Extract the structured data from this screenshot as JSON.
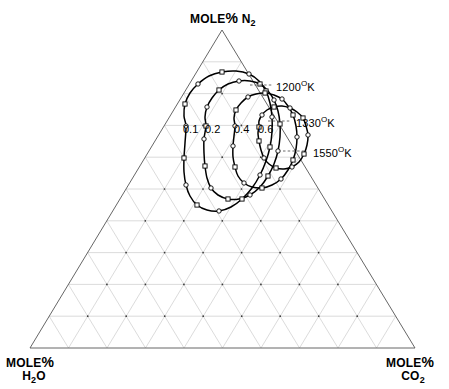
{
  "figure": {
    "kind": "ternary-phase-diagram",
    "background": "#ffffff",
    "ink": "#000000",
    "grid_color": "#b9b9b9",
    "axis_color": "#4a4a4a"
  },
  "axes": {
    "top": {
      "name": "mole-percent-n2",
      "line1": "MOLE",
      "percent": "%",
      "species": "N",
      "subscript": "2"
    },
    "bottom_left": {
      "name": "mole-percent-h2o",
      "line1": "MOLE",
      "percent": "%",
      "species": "H",
      "subscript": "2",
      "species_tail": "O"
    },
    "bottom_right": {
      "name": "mole-percent-co2",
      "line1": "MOLE",
      "percent": "%",
      "species": "CO",
      "subscript": "2"
    }
  },
  "temperature_labels": [
    {
      "value": "1200",
      "degree": "O",
      "unit": "K",
      "text": "1200OK"
    },
    {
      "value": "1330",
      "degree": "O",
      "unit": "K",
      "text": "1330OK"
    },
    {
      "value": "1550",
      "degree": "O",
      "unit": "K",
      "text": "1550OK"
    }
  ],
  "contour_value_labels": [
    "0.1",
    "0.2",
    "0.4",
    "0.6"
  ],
  "chart_data": {
    "type": "line",
    "title": "",
    "subtitle": "",
    "plot_kind": "ternary contour map",
    "xlabel": "",
    "ylabel": "",
    "grid": true,
    "legend_position": "none",
    "ternary": {
      "corners": {
        "top": "MOLE % N2",
        "bottom_left": "MOLE % H2O",
        "bottom_right": "MOLE % CO2"
      },
      "grid_divisions": 10,
      "apex_px": [
        222,
        30
      ],
      "left_px": [
        30,
        348
      ],
      "right_px": [
        415,
        348
      ]
    },
    "annotations": [
      {
        "label": "1200OK",
        "leader": true,
        "anchor_px": [
          272,
          85
        ],
        "text_px": [
          276,
          85
        ]
      },
      {
        "label": "1330OK",
        "leader": true,
        "anchor_px": [
          290,
          121
        ],
        "text_px": [
          296,
          121
        ]
      },
      {
        "label": "1550OK",
        "leader": true,
        "anchor_px": [
          305,
          151
        ],
        "text_px": [
          313,
          151
        ]
      }
    ],
    "contour_labels": [
      {
        "value": "0.1",
        "px": [
          188,
          131
        ]
      },
      {
        "value": "0.2",
        "px": [
          210,
          131
        ]
      },
      {
        "value": "0.4",
        "px": [
          239,
          131
        ]
      },
      {
        "value": "0.6",
        "px": [
          263,
          131
        ]
      }
    ],
    "series": [
      {
        "name": "0.1",
        "closed": true,
        "points_px": [
          [
            186,
            126
          ],
          [
            184,
            116
          ],
          [
            185,
            104
          ],
          [
            190,
            93
          ],
          [
            198,
            84
          ],
          [
            209,
            76
          ],
          [
            222,
            72
          ],
          [
            236,
            71
          ],
          [
            249,
            74
          ],
          [
            259,
            81
          ],
          [
            266,
            91
          ],
          [
            270,
            103
          ],
          [
            272,
            117
          ],
          [
            272,
            132
          ],
          [
            270,
            147
          ],
          [
            266,
            161
          ],
          [
            260,
            175
          ],
          [
            252,
            188
          ],
          [
            242,
            199
          ],
          [
            231,
            207
          ],
          [
            219,
            211
          ],
          [
            207,
            210
          ],
          [
            197,
            205
          ],
          [
            190,
            196
          ],
          [
            186,
            185
          ],
          [
            184,
            172
          ],
          [
            184,
            158
          ],
          [
            185,
            143
          ]
        ]
      },
      {
        "name": "0.2",
        "closed": true,
        "points_px": [
          [
            206,
            126
          ],
          [
            205,
            117
          ],
          [
            207,
            107
          ],
          [
            212,
            98
          ],
          [
            219,
            90
          ],
          [
            228,
            84
          ],
          [
            239,
            81
          ],
          [
            250,
            81
          ],
          [
            260,
            84
          ],
          [
            268,
            91
          ],
          [
            274,
            100
          ],
          [
            278,
            111
          ],
          [
            280,
            124
          ],
          [
            280,
            137
          ],
          [
            278,
            151
          ],
          [
            274,
            164
          ],
          [
            268,
            176
          ],
          [
            260,
            187
          ],
          [
            250,
            195
          ],
          [
            239,
            199
          ],
          [
            228,
            199
          ],
          [
            218,
            195
          ],
          [
            211,
            188
          ],
          [
            207,
            178
          ],
          [
            205,
            166
          ],
          [
            204,
            153
          ],
          [
            204,
            139
          ]
        ]
      },
      {
        "name": "0.4",
        "closed": true,
        "points_px": [
          [
            235,
            126
          ],
          [
            234,
            118
          ],
          [
            236,
            110
          ],
          [
            241,
            103
          ],
          [
            248,
            97
          ],
          [
            256,
            94
          ],
          [
            265,
            93
          ],
          [
            274,
            95
          ],
          [
            282,
            99
          ],
          [
            288,
            106
          ],
          [
            293,
            115
          ],
          [
            296,
            126
          ],
          [
            297,
            137
          ],
          [
            296,
            149
          ],
          [
            293,
            160
          ],
          [
            288,
            170
          ],
          [
            281,
            179
          ],
          [
            272,
            185
          ],
          [
            262,
            188
          ],
          [
            252,
            187
          ],
          [
            244,
            183
          ],
          [
            238,
            176
          ],
          [
            235,
            167
          ],
          [
            233,
            157
          ],
          [
            233,
            146
          ],
          [
            234,
            136
          ]
        ]
      },
      {
        "name": "0.6",
        "closed": true,
        "points_px": [
          [
            259,
            127
          ],
          [
            259,
            121
          ],
          [
            262,
            115
          ],
          [
            267,
            110
          ],
          [
            274,
            107
          ],
          [
            282,
            106
          ],
          [
            290,
            108
          ],
          [
            297,
            112
          ],
          [
            303,
            118
          ],
          [
            306,
            126
          ],
          [
            308,
            135
          ],
          [
            307,
            145
          ],
          [
            304,
            154
          ],
          [
            299,
            162
          ],
          [
            292,
            167
          ],
          [
            284,
            169
          ],
          [
            276,
            168
          ],
          [
            269,
            164
          ],
          [
            264,
            158
          ],
          [
            261,
            150
          ],
          [
            259,
            141
          ],
          [
            258,
            133
          ]
        ]
      }
    ],
    "markers": {
      "shapes": [
        "circle",
        "square"
      ],
      "style": "open",
      "count_approx": 60
    }
  }
}
